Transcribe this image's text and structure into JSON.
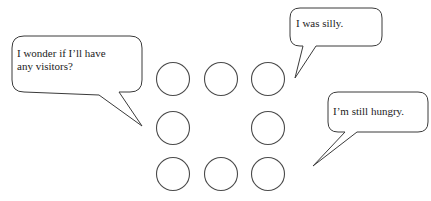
{
  "scene": {
    "title": "Speech bubbles with circle grid",
    "width": 431,
    "height": 201,
    "background_color": "#ffffff",
    "stroke_color": "#3a3a3a",
    "text_color": "#1c1c1c"
  },
  "bubbles": [
    {
      "id": "wonder",
      "text": "I wonder if I’ll have\nany visitors?",
      "tail_direction": "down-right",
      "box": {
        "x": 12,
        "y": 36,
        "width": 130,
        "height": 56
      },
      "tail_tip": {
        "x": 142,
        "y": 126
      }
    },
    {
      "id": "silly",
      "text": "I was silly.",
      "tail_direction": "down-left",
      "box": {
        "x": 290,
        "y": 8,
        "width": 92,
        "height": 38
      },
      "tail_tip": {
        "x": 295,
        "y": 78
      }
    },
    {
      "id": "hungry",
      "text": "I’m still hungry.",
      "tail_direction": "down-left",
      "box": {
        "x": 328,
        "y": 92,
        "width": 100,
        "height": 40
      },
      "tail_tip": {
        "x": 313,
        "y": 166
      }
    }
  ],
  "circle_grid": {
    "rows": 3,
    "columns": 3,
    "center_empty": true,
    "count": 8,
    "radius": 16.5,
    "fill_color": "#ffffff",
    "stroke_color": "#4a4a4a",
    "circles": [
      {
        "name": "circle-top-left",
        "cx": 173,
        "cy": 79
      },
      {
        "name": "circle-top-center",
        "cx": 221,
        "cy": 79
      },
      {
        "name": "circle-top-right",
        "cx": 268,
        "cy": 79
      },
      {
        "name": "circle-middle-left",
        "cx": 173,
        "cy": 128
      },
      {
        "name": "circle-middle-right",
        "cx": 268,
        "cy": 128
      },
      {
        "name": "circle-bottom-left",
        "cx": 173,
        "cy": 174
      },
      {
        "name": "circle-bottom-center",
        "cx": 221,
        "cy": 174
      },
      {
        "name": "circle-bottom-right",
        "cx": 268,
        "cy": 174
      }
    ]
  }
}
